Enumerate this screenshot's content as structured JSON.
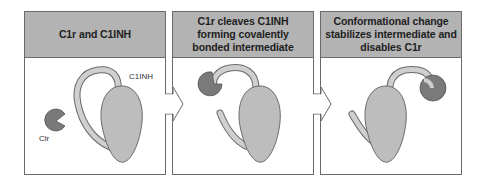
{
  "panels": [
    {
      "title": "C1r and C1INH",
      "labels": {
        "c1inh": "C1INH",
        "c1r": "Clr"
      }
    },
    {
      "title_lines": [
        "C1r cleaves C1INH",
        "forming covalently",
        "bonded intermediate"
      ]
    },
    {
      "title_lines": [
        "Conformational change",
        "stabilizes intermediate and",
        "disables C1r"
      ]
    }
  ],
  "arrows": [
    {
      "from": "panel-1",
      "to": "panel-2",
      "icon": "right-arrow-icon"
    },
    {
      "from": "panel-2",
      "to": "panel-3",
      "icon": "right-arrow-icon"
    }
  ],
  "colors": {
    "header_bg": "#b3b3b3",
    "border": "#6a6a6a",
    "c1inh_body": "#bdbdbd",
    "c1r": "#7a7a7a",
    "loop_fill": "#c8c8c8"
  }
}
